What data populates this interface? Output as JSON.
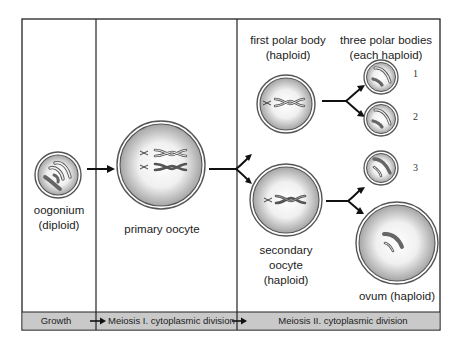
{
  "diagram": {
    "colors": {
      "frame": "#222222",
      "bar_fill": "#c8c8c8",
      "cell_edge": "#6a6a6a",
      "cell_fill_center": "#ffffff",
      "cell_fill_edge": "#a9a9a9",
      "chromosome_dark": "#6e6e6e",
      "chromosome_light": "#e8e8e8"
    },
    "cells": {
      "oogonium": {
        "label_line1": "oogonium",
        "label_line2": "(diploid)"
      },
      "primary_oocyte": {
        "label": "primary oocyte"
      },
      "first_polar_body": {
        "label_line1": "first polar body",
        "label_line2": "(haploid)"
      },
      "secondary_oocyte": {
        "label_line1": "secondary",
        "label_line2": "oocyte",
        "label_line3": "(haploid)"
      },
      "three_polar_bodies": {
        "label_line1": "three polar bodies",
        "label_line2": "(each haploid)",
        "numbers": [
          "1",
          "2",
          "3"
        ]
      },
      "ovum": {
        "label": "ovum (haploid)"
      }
    },
    "stages": [
      {
        "label": "Growth"
      },
      {
        "label": "Meiosis I. cytoplasmic division"
      },
      {
        "label": "Meiosis II. cytoplasmic division"
      }
    ]
  }
}
